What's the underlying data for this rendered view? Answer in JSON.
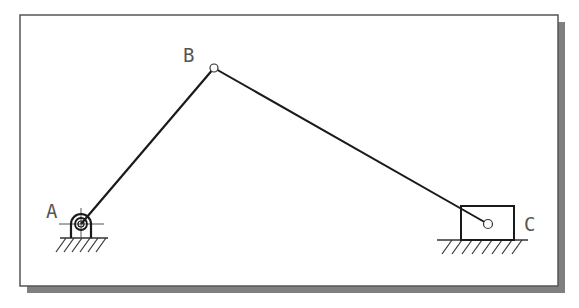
{
  "diagram": {
    "labels": {
      "A": "A",
      "B": "B",
      "C": "C"
    },
    "joints": {
      "A": {
        "x": 81,
        "y": 224,
        "type": "fixed-pivot"
      },
      "B": {
        "x": 214,
        "y": 68,
        "type": "pin"
      },
      "C": {
        "x": 488,
        "y": 224,
        "type": "slider-pin"
      }
    },
    "links": [
      {
        "from": "A",
        "to": "B",
        "name": "crank"
      },
      {
        "from": "B",
        "to": "C",
        "name": "connecting-rod"
      }
    ],
    "colors": {
      "line": "#1a1a1a",
      "frame": "#555555",
      "shadow": "#808080",
      "label": "#555555",
      "background": "#ffffff"
    }
  }
}
